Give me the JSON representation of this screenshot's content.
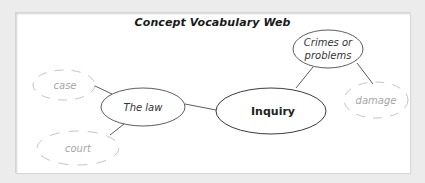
{
  "title": "Concept Vocabulary Web",
  "colors": {
    "background": "#ececec",
    "card": "#ffffff",
    "solid_stroke": "#4a4a4a",
    "dashed_stroke": "#bdbdbd",
    "text": "#222222",
    "faint_text": "#a6a6a6"
  },
  "nodes": {
    "inquiry": {
      "label": "Inquiry",
      "style": "solid-main"
    },
    "the_law": {
      "label": "The law",
      "style": "solid"
    },
    "crimes": {
      "label": "Crimes or",
      "label2": "problems",
      "style": "solid"
    },
    "case": {
      "label": "case",
      "style": "dashed"
    },
    "court": {
      "label": "court",
      "style": "dashed"
    },
    "damage": {
      "label": "damage",
      "style": "dashed"
    }
  },
  "edges": [
    {
      "from": "the_law",
      "to": "inquiry"
    },
    {
      "from": "crimes",
      "to": "inquiry"
    },
    {
      "from": "crimes",
      "to": "damage"
    },
    {
      "from": "the_law",
      "to": "case"
    },
    {
      "from": "the_law",
      "to": "court"
    }
  ]
}
